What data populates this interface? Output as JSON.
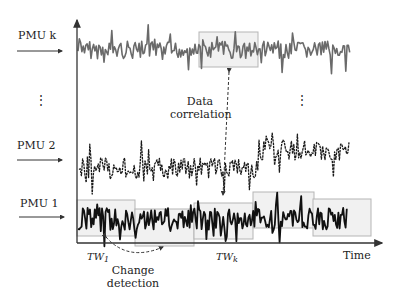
{
  "diagram": {
    "colors": {
      "axis": "#333333",
      "pmu_k_signal": "#6a6a6a",
      "pmu_2_signal": "#1a1a1a",
      "pmu_1_signal": "#111111",
      "window_fill": "#f1f1f1",
      "window_border": "#b5b5b5",
      "text": "#222222"
    },
    "rows": [
      {
        "id": "pmu_k",
        "label": "PMU k"
      },
      {
        "id": "pmu_2",
        "label": "PMU 2"
      },
      {
        "id": "pmu_1",
        "label": "PMU 1"
      }
    ],
    "ellipsis_left": "⋮",
    "ellipsis_right": "⋮",
    "annotations": {
      "data_correlation": {
        "line1": "Data",
        "line2": "correlation"
      },
      "change_detection": {
        "line1": "Change",
        "line2": "detection"
      }
    },
    "time_windows": {
      "first": {
        "base": "TW",
        "sub": "1"
      },
      "k": {
        "base": "TW",
        "sub": "k"
      }
    },
    "axis": {
      "x_label": "Time"
    }
  }
}
